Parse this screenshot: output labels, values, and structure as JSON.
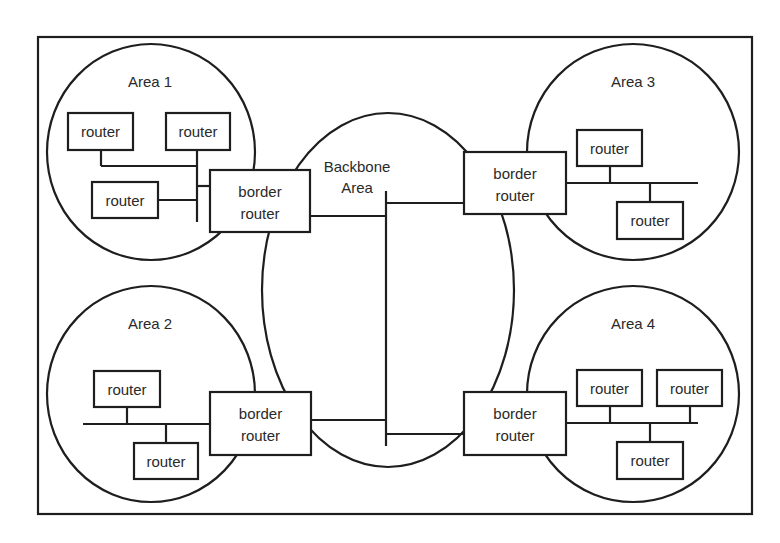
{
  "diagram": {
    "backbone": {
      "label_line1": "Backbone",
      "label_line2": "Area"
    },
    "areas": [
      {
        "name": "Area 1",
        "routers": [
          "router",
          "router",
          "router"
        ],
        "border_router": {
          "line1": "border",
          "line2": "router"
        }
      },
      {
        "name": "Area 2",
        "routers": [
          "router",
          "router"
        ],
        "border_router": {
          "line1": "border",
          "line2": "router"
        }
      },
      {
        "name": "Area 3",
        "routers": [
          "router",
          "router"
        ],
        "border_router": {
          "line1": "border",
          "line2": "router"
        }
      },
      {
        "name": "Area 4",
        "routers": [
          "router",
          "router",
          "router"
        ],
        "border_router": {
          "line1": "border",
          "line2": "router"
        }
      }
    ],
    "colors": {
      "stroke": "#1e1e1e",
      "text": "#2a2a2a",
      "background": "#ffffff"
    }
  }
}
